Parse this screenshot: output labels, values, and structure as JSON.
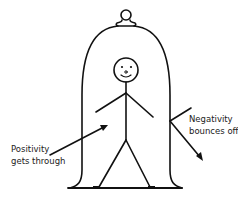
{
  "diagram": {
    "labels": {
      "positivity_line1": "Positivity",
      "positivity_line2": "gets through",
      "negativity_line1": "Negativity",
      "negativity_line2": "bounces off"
    },
    "colors": {
      "stroke": "#111111",
      "background": "#ffffff",
      "text": "#222222"
    }
  }
}
